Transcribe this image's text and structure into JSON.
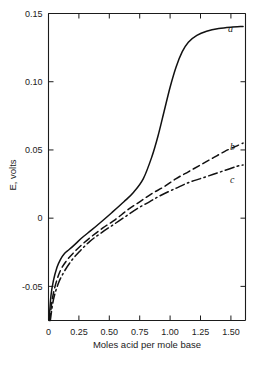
{
  "chart_data": {
    "type": "line",
    "title": "",
    "xlabel": "Moles acid per mole base",
    "ylabel": "E, volts",
    "xlim": [
      0,
      1.62
    ],
    "ylim": [
      -0.075,
      0.15
    ],
    "grid": false,
    "legend_position": "inline-curve-labels",
    "xticks": [
      0,
      0.25,
      0.5,
      0.75,
      1.0,
      1.25,
      1.5
    ],
    "xtick_labels": [
      "0",
      "0.25",
      "0.50",
      "0.75",
      "1.00",
      "1.25",
      "1.50"
    ],
    "yticks": [
      -0.05,
      0,
      0.05,
      0.1,
      0.15
    ],
    "ytick_labels": [
      "-0.05",
      "0",
      "0.05",
      "0.10",
      "0.15"
    ],
    "series": [
      {
        "name": "a",
        "label": "a",
        "style": "solid",
        "x": [
          0.005,
          0.02,
          0.04,
          0.07,
          0.1,
          0.13,
          0.17,
          0.22,
          0.28,
          0.35,
          0.43,
          0.52,
          0.62,
          0.7,
          0.78,
          0.85,
          0.9,
          0.95,
          1.0,
          1.05,
          1.1,
          1.15,
          1.22,
          1.3,
          1.4,
          1.5,
          1.6
        ],
        "y": [
          -0.075,
          -0.057,
          -0.046,
          -0.036,
          -0.03,
          -0.026,
          -0.023,
          -0.019,
          -0.014,
          -0.009,
          -0.003,
          0.004,
          0.012,
          0.019,
          0.029,
          0.045,
          0.06,
          0.078,
          0.096,
          0.111,
          0.122,
          0.129,
          0.134,
          0.137,
          0.139,
          0.14,
          0.1405
        ]
      },
      {
        "name": "b",
        "label": "b",
        "style": "dashed",
        "x": [
          0.01,
          0.03,
          0.06,
          0.1,
          0.15,
          0.21,
          0.28,
          0.36,
          0.45,
          0.55,
          0.65,
          0.75,
          0.85,
          0.95,
          1.05,
          1.15,
          1.25,
          1.35,
          1.45,
          1.55,
          1.6
        ],
        "y": [
          -0.075,
          -0.06,
          -0.048,
          -0.038,
          -0.031,
          -0.025,
          -0.019,
          -0.013,
          -0.007,
          -0.001,
          0.006,
          0.012,
          0.018,
          0.023,
          0.029,
          0.034,
          0.039,
          0.044,
          0.049,
          0.053,
          0.055
        ]
      },
      {
        "name": "c",
        "label": "c",
        "style": "dashdot",
        "x": [
          0.015,
          0.04,
          0.08,
          0.13,
          0.19,
          0.26,
          0.34,
          0.43,
          0.53,
          0.63,
          0.73,
          0.83,
          0.93,
          1.05,
          1.15,
          1.25,
          1.35,
          1.45,
          1.55,
          1.6
        ],
        "y": [
          -0.075,
          -0.06,
          -0.048,
          -0.039,
          -0.031,
          -0.024,
          -0.017,
          -0.011,
          -0.005,
          0.001,
          0.007,
          0.012,
          0.017,
          0.022,
          0.026,
          0.029,
          0.032,
          0.035,
          0.038,
          0.039
        ]
      }
    ]
  },
  "axes": {
    "x_title": "Moles acid per mole base",
    "y_title": "E, volts",
    "x_tick_labels": [
      "0",
      "0.25",
      "0.50",
      "0.75",
      "1.00",
      "1.25",
      "1.50"
    ],
    "y_tick_labels": [
      "0.15",
      "0.10",
      "0.05",
      "0",
      "-0.05"
    ]
  },
  "curve_labels": {
    "a": "a",
    "b": "b",
    "c": "c"
  },
  "colors": {
    "ink": "#1b1b1b",
    "background": "#ffffff"
  }
}
